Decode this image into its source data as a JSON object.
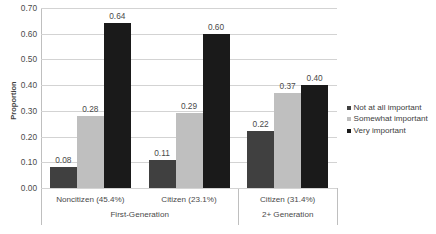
{
  "chart_data": {
    "type": "bar",
    "title": "",
    "xlabel": "",
    "ylabel": "Proportion",
    "ylim": [
      0.0,
      0.7
    ],
    "ytick_step": 0.1,
    "yticks": [
      "0.70",
      "0.60",
      "0.50",
      "0.40",
      "0.30",
      "0.20",
      "0.10",
      "0.00"
    ],
    "grid": true,
    "legend_position": "right",
    "categories": [
      "Noncitizen (45.4%)",
      "Citizen (23.1%)",
      "Citizen (31.4%)"
    ],
    "groups": [
      {
        "label": "First-Generation",
        "span": 2
      },
      {
        "label": "2+ Generation",
        "span": 1
      }
    ],
    "series": [
      {
        "name": "Not at all important",
        "color": "#404040",
        "values": [
          0.08,
          0.11,
          0.22
        ],
        "labels": [
          "0.08",
          "0.11",
          "0.22"
        ]
      },
      {
        "name": "Somewhat important",
        "color": "#bfbfbf",
        "values": [
          0.28,
          0.29,
          0.37
        ],
        "labels": [
          "0.28",
          "0.29",
          "0.37"
        ]
      },
      {
        "name": "Very important",
        "color": "#1a1a1a",
        "values": [
          0.64,
          0.6,
          0.4
        ],
        "labels": [
          "0.64",
          "0.60",
          "0.40"
        ]
      }
    ]
  }
}
